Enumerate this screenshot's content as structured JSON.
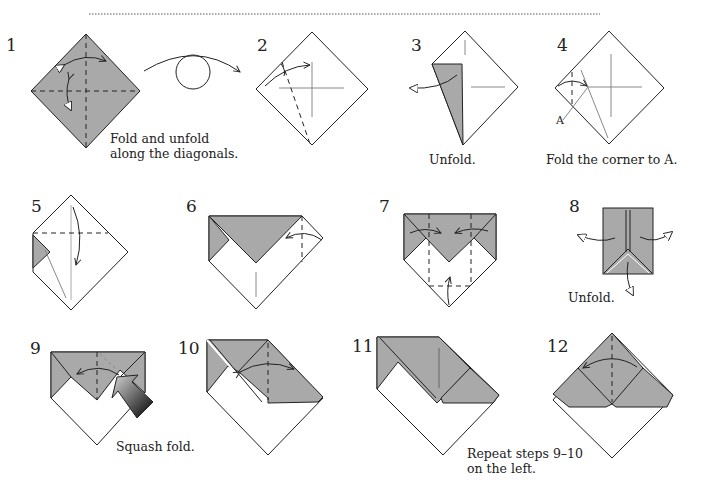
{
  "colors": {
    "paper_colored": "#a9a9a9",
    "paper_white": "#ffffff",
    "line": "#222222",
    "crease": "#888888"
  },
  "steps": [
    {
      "number": "1",
      "caption_line1": "Fold and unfold",
      "caption_line2": "along the diagonals."
    },
    {
      "number": "2",
      "caption_line1": "",
      "caption_line2": ""
    },
    {
      "number": "3",
      "caption_line1": "Unfold.",
      "caption_line2": ""
    },
    {
      "number": "4",
      "caption_line1": "Fold the corner to A.",
      "caption_line2": "",
      "point_label": "A"
    },
    {
      "number": "5",
      "caption_line1": "",
      "caption_line2": ""
    },
    {
      "number": "6",
      "caption_line1": "",
      "caption_line2": ""
    },
    {
      "number": "7",
      "caption_line1": "",
      "caption_line2": ""
    },
    {
      "number": "8",
      "caption_line1": "Unfold.",
      "caption_line2": ""
    },
    {
      "number": "9",
      "caption_line1": "Squash fold.",
      "caption_line2": ""
    },
    {
      "number": "10",
      "caption_line1": "",
      "caption_line2": ""
    },
    {
      "number": "11",
      "caption_line1": "Repeat steps 9–10",
      "caption_line2": "on the left."
    },
    {
      "number": "12",
      "caption_line1": "",
      "caption_line2": ""
    }
  ],
  "symbols": {
    "turn_over": "turn-over-symbol",
    "squash_arrow": "push-arrow"
  }
}
